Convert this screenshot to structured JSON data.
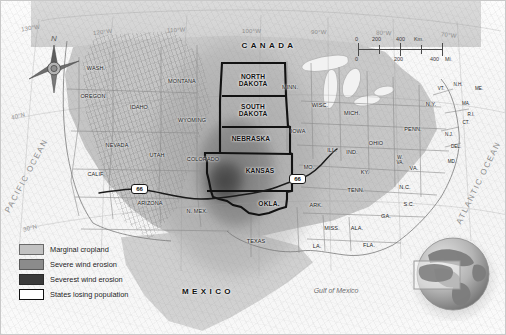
{
  "map": {
    "title": "Dust Bowl Map of the United States",
    "countries": [
      {
        "name": "CANADA",
        "x": 268,
        "y": 45
      },
      {
        "name": "MEXICO",
        "x": 207,
        "y": 291
      }
    ],
    "water_labels": [
      {
        "name": "PACIFIC OCEAN",
        "x": 26,
        "y": 175,
        "rotate": -62
      },
      {
        "name": "ATLANTIC OCEAN",
        "x": 478,
        "y": 182,
        "rotate": -64
      },
      {
        "name": "Gulf of Mexico",
        "x": 335,
        "y": 290
      }
    ],
    "dust_bowl_states": [
      {
        "name": "NORTH DAKOTA",
        "line1": "NORTH",
        "line2": "DAKOTA",
        "x": 252,
        "y": 80
      },
      {
        "name": "SOUTH DAKOTA",
        "line1": "SOUTH",
        "line2": "DAKOTA",
        "x": 252,
        "y": 110
      },
      {
        "name": "NEBRASKA",
        "line1": "NEBRASKA",
        "line2": "",
        "x": 250,
        "y": 138
      },
      {
        "name": "KANSAS",
        "line1": "KANSAS",
        "line2": "",
        "x": 259,
        "y": 170
      },
      {
        "name": "OKLA.",
        "line1": "OKLA.",
        "line2": "",
        "x": 268,
        "y": 203
      }
    ],
    "states": [
      {
        "name": "WASH.",
        "x": 95,
        "y": 68,
        "size": "sm"
      },
      {
        "name": "OREGON",
        "x": 92,
        "y": 96,
        "size": "sm"
      },
      {
        "name": "IDAHO",
        "x": 138,
        "y": 107,
        "size": "sm"
      },
      {
        "name": "MONTANA",
        "x": 181,
        "y": 81,
        "size": "sm"
      },
      {
        "name": "WYOMING",
        "x": 191,
        "y": 120,
        "size": "sm"
      },
      {
        "name": "NEVADA",
        "x": 116,
        "y": 145,
        "size": "sm"
      },
      {
        "name": "UTAH",
        "x": 156,
        "y": 155,
        "size": "sm"
      },
      {
        "name": "COLORADO",
        "x": 202,
        "y": 159,
        "size": "sm"
      },
      {
        "name": "CALIF.",
        "x": 95,
        "y": 174,
        "size": "sm"
      },
      {
        "name": "ARIZONA",
        "x": 149,
        "y": 203,
        "size": "sm"
      },
      {
        "name": "N. MEX.",
        "x": 196,
        "y": 211,
        "size": "sm"
      },
      {
        "name": "TEXAS",
        "x": 255,
        "y": 241,
        "size": "sm"
      },
      {
        "name": "MINN.",
        "x": 289,
        "y": 87,
        "size": "sm"
      },
      {
        "name": "IOWA",
        "x": 297,
        "y": 131,
        "size": "sm"
      },
      {
        "name": "WISC.",
        "x": 319,
        "y": 105,
        "size": "sm"
      },
      {
        "name": "MICH.",
        "x": 351,
        "y": 113,
        "size": "sm"
      },
      {
        "name": "MO.",
        "x": 308,
        "y": 167,
        "size": "sm"
      },
      {
        "name": "ILL.",
        "x": 331,
        "y": 150,
        "size": "sm"
      },
      {
        "name": "IND.",
        "x": 351,
        "y": 152,
        "size": "sm"
      },
      {
        "name": "OHIO",
        "x": 375,
        "y": 143,
        "size": "sm"
      },
      {
        "name": "ARK.",
        "x": 315,
        "y": 205,
        "size": "sm"
      },
      {
        "name": "MISS.",
        "x": 331,
        "y": 228,
        "size": "sm"
      },
      {
        "name": "ALA.",
        "x": 356,
        "y": 228,
        "size": "sm"
      },
      {
        "name": "LA.",
        "x": 316,
        "y": 246,
        "size": "sm"
      },
      {
        "name": "TENN.",
        "x": 355,
        "y": 190,
        "size": "sm"
      },
      {
        "name": "KY.",
        "x": 364,
        "y": 172,
        "size": "sm"
      },
      {
        "name": "GA.",
        "x": 385,
        "y": 216,
        "size": "sm"
      },
      {
        "name": "FLA.",
        "x": 368,
        "y": 245,
        "size": "sm"
      },
      {
        "name": "S.C.",
        "x": 408,
        "y": 204,
        "size": "sm"
      },
      {
        "name": "N.C.",
        "x": 404,
        "y": 187,
        "size": "sm"
      },
      {
        "name": "VA.",
        "x": 413,
        "y": 168,
        "size": "sm"
      },
      {
        "name": "W. VA.",
        "line1": "W.",
        "line2": "VA.",
        "x": 399,
        "y": 160,
        "size": "tiny"
      },
      {
        "name": "PENN.",
        "x": 412,
        "y": 129,
        "size": "sm"
      },
      {
        "name": "N.Y.",
        "x": 430,
        "y": 104,
        "size": "sm"
      },
      {
        "name": "MD.",
        "x": 451,
        "y": 161,
        "size": "tiny"
      },
      {
        "name": "DEL.",
        "x": 455,
        "y": 146,
        "size": "tiny"
      },
      {
        "name": "N.J.",
        "x": 448,
        "y": 134,
        "size": "tiny"
      },
      {
        "name": "CT.",
        "x": 465,
        "y": 122,
        "size": "tiny"
      },
      {
        "name": "R.I.",
        "x": 470,
        "y": 114,
        "size": "tiny"
      },
      {
        "name": "MA.",
        "x": 465,
        "y": 103,
        "size": "tiny"
      },
      {
        "name": "VT.",
        "x": 440,
        "y": 88,
        "size": "tiny"
      },
      {
        "name": "N.H.",
        "x": 457,
        "y": 84,
        "size": "tiny"
      },
      {
        "name": "ME.",
        "x": 478,
        "y": 88,
        "size": "tiny"
      }
    ],
    "graticule_labels": [
      {
        "label": "130°W",
        "x": 33,
        "y": 28
      },
      {
        "label": "120°W",
        "x": 106,
        "y": 32
      },
      {
        "label": "110°W",
        "x": 180,
        "y": 30
      },
      {
        "label": "100°W",
        "x": 255,
        "y": 31
      },
      {
        "label": "90°W",
        "x": 322,
        "y": 32
      },
      {
        "label": "80°W",
        "x": 387,
        "y": 32
      },
      {
        "label": "70°W",
        "x": 452,
        "y": 33
      },
      {
        "label": "40°N",
        "x": 21,
        "y": 118
      },
      {
        "label": "30°N",
        "x": 32,
        "y": 230
      }
    ],
    "compass": {
      "north_label": "N"
    },
    "scale_bar": {
      "km_unit": "Km.",
      "mi_unit": "Mi.",
      "km_ticks": [
        "0",
        "200",
        "400"
      ],
      "mi_ticks": [
        "0",
        "200",
        "400"
      ]
    },
    "route_markers": [
      {
        "label": "66",
        "x": 138,
        "y": 188
      },
      {
        "label": "66",
        "x": 296,
        "y": 178
      },
      {
        "label": "66",
        "x": 222,
        "y": 194
      }
    ],
    "legend": {
      "items": [
        {
          "label": "Marginal cropland",
          "color": "#c2c2c2",
          "border": "#6a6a6a"
        },
        {
          "label": "Severe wind erosion",
          "color": "#8b8b8b",
          "border": "#5a5a5a"
        },
        {
          "label": "Severest wind erosion",
          "color": "#3a3a3a",
          "border": "#2a2a2a"
        },
        {
          "label": "States losing population",
          "color": "#ffffff",
          "border": "#111111"
        }
      ]
    },
    "globe_inset": {
      "name": "world-globe-locator",
      "highlight_region": "North America"
    }
  }
}
